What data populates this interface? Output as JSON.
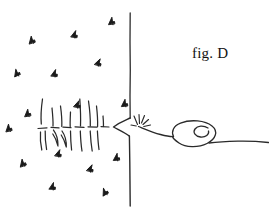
{
  "figure": {
    "label": "fig. D",
    "label_position": {
      "x": 192,
      "y": 45
    },
    "background_color": "#ffffff",
    "ink_color": "#1a1a1a",
    "canvas": {
      "width": 269,
      "height": 224
    }
  },
  "elements": {
    "boundary_line": {
      "name": "vertical-boundary-line",
      "top": {
        "x": 130,
        "y": 13
      },
      "notch_top": {
        "x": 130,
        "y": 118
      },
      "notch_tip": {
        "x": 113,
        "y": 127
      },
      "notch_bottom": {
        "x": 129,
        "y": 136
      },
      "bottom": {
        "x": 130,
        "y": 206
      },
      "stroke_width": 1.4,
      "color": "#2a2a2a"
    },
    "ground_line": {
      "name": "dashed-ground-line",
      "y": 127,
      "x_start": 38,
      "x_end": 113,
      "style": "dashed"
    },
    "grass_strokes": {
      "name": "grass-hatching",
      "count": 12,
      "x_range": [
        40,
        103
      ],
      "y_range": [
        98,
        152
      ]
    },
    "spark": {
      "name": "spark-burst",
      "center": {
        "x": 140,
        "y": 121
      },
      "ray_count": 6
    },
    "spiral_curve": {
      "name": "looping-spiral-curve",
      "start": {
        "x": 139,
        "y": 124
      },
      "loop_center": {
        "x": 196,
        "y": 136
      },
      "end": {
        "x": 268,
        "y": 142
      }
    },
    "scatter_marks": {
      "name": "scatter-marks",
      "count": 16,
      "points": [
        {
          "x": 111,
          "y": 21
        },
        {
          "x": 74,
          "y": 34
        },
        {
          "x": 31,
          "y": 40
        },
        {
          "x": 98,
          "y": 62
        },
        {
          "x": 16,
          "y": 73
        },
        {
          "x": 54,
          "y": 73
        },
        {
          "x": 27,
          "y": 113
        },
        {
          "x": 77,
          "y": 104
        },
        {
          "x": 124,
          "y": 103
        },
        {
          "x": 58,
          "y": 153
        },
        {
          "x": 116,
          "y": 157
        },
        {
          "x": 22,
          "y": 163
        },
        {
          "x": 90,
          "y": 168
        },
        {
          "x": 52,
          "y": 186
        },
        {
          "x": 104,
          "y": 192
        },
        {
          "x": 8,
          "y": 128
        }
      ]
    }
  }
}
